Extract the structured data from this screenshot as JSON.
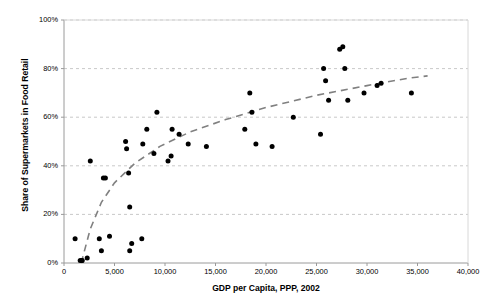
{
  "chart_data": {
    "type": "scatter",
    "title": "",
    "xlabel": "GDP per Capita, PPP, 2002",
    "ylabel": "Share of Supermarkets in Food Retail",
    "xlim": [
      0,
      40000
    ],
    "ylim": [
      0,
      100
    ],
    "xticks": [
      0,
      5000,
      10000,
      15000,
      20000,
      25000,
      30000,
      35000,
      40000
    ],
    "xtick_labels": [
      "0",
      "5,000",
      "10,000",
      "15,000",
      "20,000",
      "25,000",
      "30,000",
      "35,000",
      "40,000"
    ],
    "yticks": [
      0,
      20,
      40,
      60,
      80,
      100
    ],
    "ytick_labels": [
      "0%",
      "20%",
      "40%",
      "60%",
      "80%",
      "100%"
    ],
    "grid": "horizontal-dashed",
    "legend": "none",
    "marker": {
      "shape": "circle",
      "color": "#000000",
      "size": 5
    },
    "points": [
      {
        "x": 1100,
        "y": 10
      },
      {
        "x": 1600,
        "y": 1
      },
      {
        "x": 1750,
        "y": 1
      },
      {
        "x": 1800,
        "y": 1
      },
      {
        "x": 2300,
        "y": 2
      },
      {
        "x": 2600,
        "y": 42
      },
      {
        "x": 3500,
        "y": 10
      },
      {
        "x": 3700,
        "y": 5
      },
      {
        "x": 3900,
        "y": 35
      },
      {
        "x": 4100,
        "y": 35
      },
      {
        "x": 4500,
        "y": 11
      },
      {
        "x": 6100,
        "y": 50
      },
      {
        "x": 6200,
        "y": 47
      },
      {
        "x": 6400,
        "y": 37
      },
      {
        "x": 6500,
        "y": 23
      },
      {
        "x": 6500,
        "y": 5
      },
      {
        "x": 6700,
        "y": 8
      },
      {
        "x": 7700,
        "y": 10
      },
      {
        "x": 7800,
        "y": 49
      },
      {
        "x": 8200,
        "y": 55
      },
      {
        "x": 8900,
        "y": 45
      },
      {
        "x": 9200,
        "y": 62
      },
      {
        "x": 10300,
        "y": 42
      },
      {
        "x": 10600,
        "y": 44
      },
      {
        "x": 10700,
        "y": 55
      },
      {
        "x": 11400,
        "y": 53
      },
      {
        "x": 12300,
        "y": 49
      },
      {
        "x": 14100,
        "y": 48
      },
      {
        "x": 17900,
        "y": 55
      },
      {
        "x": 18400,
        "y": 70
      },
      {
        "x": 18600,
        "y": 62
      },
      {
        "x": 19000,
        "y": 49
      },
      {
        "x": 20600,
        "y": 48
      },
      {
        "x": 22700,
        "y": 60
      },
      {
        "x": 25400,
        "y": 53
      },
      {
        "x": 25700,
        "y": 80
      },
      {
        "x": 25900,
        "y": 75
      },
      {
        "x": 26200,
        "y": 67
      },
      {
        "x": 27300,
        "y": 88
      },
      {
        "x": 27600,
        "y": 89
      },
      {
        "x": 27800,
        "y": 80
      },
      {
        "x": 28100,
        "y": 67
      },
      {
        "x": 29700,
        "y": 70
      },
      {
        "x": 31000,
        "y": 73
      },
      {
        "x": 31400,
        "y": 74
      },
      {
        "x": 34400,
        "y": 70
      }
    ],
    "trendline": {
      "style": "dashed",
      "color": "#808080",
      "description": "logarithmic fit",
      "path": [
        {
          "x": 1700,
          "y": 0
        },
        {
          "x": 2600,
          "y": 14
        },
        {
          "x": 3700,
          "y": 25
        },
        {
          "x": 5000,
          "y": 33
        },
        {
          "x": 7000,
          "y": 41
        },
        {
          "x": 9500,
          "y": 48
        },
        {
          "x": 12500,
          "y": 54
        },
        {
          "x": 16000,
          "y": 59
        },
        {
          "x": 20000,
          "y": 64
        },
        {
          "x": 25000,
          "y": 69
        },
        {
          "x": 30000,
          "y": 73
        },
        {
          "x": 34000,
          "y": 76
        },
        {
          "x": 36000,
          "y": 77
        }
      ]
    }
  },
  "axes": {
    "y_title": "Share of Supermarkets in Food Retail",
    "x_title": "GDP per Capita, PPP, 2002"
  }
}
